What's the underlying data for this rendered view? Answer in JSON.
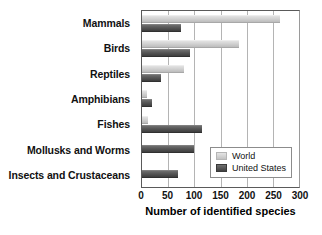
{
  "chart_data": {
    "type": "bar",
    "orientation": "horizontal",
    "title": "",
    "xlabel": "Number of identified species",
    "ylabel": "",
    "xlim": [
      0,
      300
    ],
    "xticks": [
      0,
      50,
      100,
      150,
      200,
      250,
      300
    ],
    "grid": true,
    "legend_position": "bottom-right",
    "categories": [
      "Mammals",
      "Birds",
      "Reptiles",
      "Amphibians",
      "Fishes",
      "Mollusks and Worms",
      "Insects and Crustaceans"
    ],
    "series": [
      {
        "name": "World",
        "color": "#d2d2d2",
        "values": [
          264,
          185,
          80,
          10,
          12,
          0,
          0
        ]
      },
      {
        "name": "United States",
        "color": "#565656",
        "values": [
          74,
          92,
          37,
          20,
          115,
          100,
          68
        ]
      }
    ]
  }
}
